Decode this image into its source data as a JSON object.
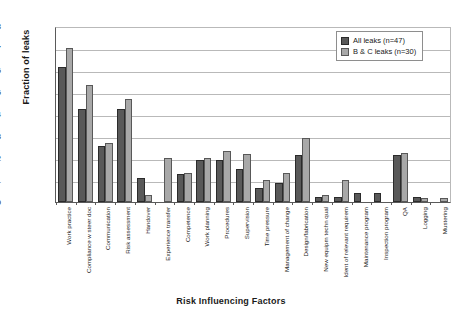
{
  "chart_data": {
    "type": "bar",
    "title": "",
    "xlabel": "Risk Influencing Factors",
    "ylabel": "Fraction of leaks",
    "ylim": [
      0,
      0.8
    ],
    "ytick_labels": [
      "0.8",
      "0.7",
      "0.6",
      "0.5",
      "0.4",
      "0.3",
      "0.2",
      "0.1",
      "0"
    ],
    "ytick_values": [
      0.8,
      0.7,
      0.6,
      0.5,
      0.4,
      0.3,
      0.2,
      0.1,
      0
    ],
    "grid": true,
    "legend_position": "top-right",
    "categories": [
      "Work practice",
      "Compliance w steer doc",
      "Communication",
      "Risk assessment",
      "Handover",
      "Experience transfer",
      "Competence",
      "Work planning",
      "Procedures",
      "Supervision",
      "Time pressure",
      "Management of change",
      "Design/fabrication",
      "New equipm techn qual",
      "Ident of relevant requirem",
      "Maintenance program",
      "Inspection program",
      "QA",
      "Logging",
      "Mustering"
    ],
    "series": [
      {
        "name": "All leaks (n=47)",
        "color": "#595959",
        "values": [
          0.615,
          0.425,
          0.255,
          0.425,
          0.107,
          0.0,
          0.128,
          0.191,
          0.191,
          0.149,
          0.064,
          0.085,
          0.213,
          0.021,
          0.021,
          0.043,
          0.043,
          0.213,
          0.021,
          0.0
        ]
      },
      {
        "name": "B & C leaks (n=30)",
        "color": "#a8a8a8",
        "values": [
          0.7,
          0.533,
          0.267,
          0.467,
          0.033,
          0.2,
          0.133,
          0.2,
          0.233,
          0.218,
          0.1,
          0.133,
          0.29,
          0.033,
          0.1,
          0.0,
          0.0,
          0.222,
          0.018,
          0.018
        ]
      }
    ]
  },
  "legend": {
    "items": [
      {
        "label": "All leaks (n=47)"
      },
      {
        "label": "B & C leaks (n=30)"
      }
    ]
  }
}
